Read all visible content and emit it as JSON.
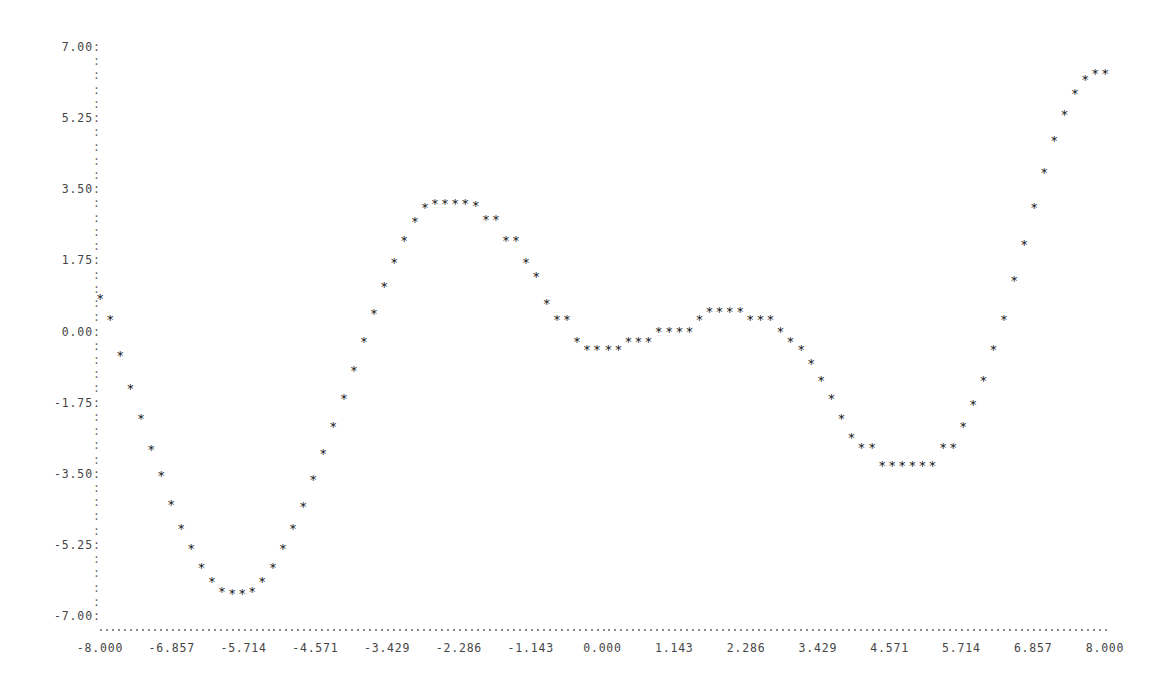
{
  "chart_data": {
    "type": "scatter",
    "title": "",
    "subtitle": "",
    "xlabel": "",
    "ylabel": "",
    "xlim": [
      -8.0,
      8.0
    ],
    "ylim": [
      -7.0,
      7.0
    ],
    "grid": false,
    "legend": null,
    "marker": "asterisk",
    "marker_color": "#1a1a1a",
    "x_tick_labels": [
      "-8.000",
      "-6.857",
      "-5.714",
      "-4.571",
      "-3.429",
      "-2.286",
      "-1.143",
      "0.000",
      "1.143",
      "2.286",
      "3.429",
      "4.571",
      "5.714",
      "6.857",
      "8.000"
    ],
    "x_tick_values": [
      -8.0,
      -6.857,
      -5.714,
      -4.571,
      -3.429,
      -2.286,
      -1.143,
      0.0,
      1.143,
      2.286,
      3.429,
      4.571,
      5.714,
      6.857,
      8.0
    ],
    "y_tick_labels": [
      "7.00",
      "5.25",
      "3.50",
      "1.75",
      "0.00",
      "-1.75",
      "-3.50",
      "-5.25",
      "-7.00"
    ],
    "y_tick_values": [
      7.0,
      5.25,
      3.5,
      1.75,
      0.0,
      -1.75,
      -3.5,
      -5.25,
      -7.0
    ],
    "y_minor_per_interval": 4,
    "series": [
      {
        "name": "series-1",
        "x": [
          -8.0,
          -7.84,
          -7.68,
          -7.52,
          -7.35,
          -7.19,
          -7.03,
          -6.87,
          -6.71,
          -6.55,
          -6.39,
          -6.22,
          -6.06,
          -5.9,
          -5.74,
          -5.58,
          -5.42,
          -5.25,
          -5.09,
          -4.93,
          -4.77,
          -4.61,
          -4.45,
          -4.29,
          -4.12,
          -3.96,
          -3.8,
          -3.64,
          -3.48,
          -3.32,
          -3.16,
          -2.99,
          -2.83,
          -2.67,
          -2.51,
          -2.35,
          -2.19,
          -2.02,
          -1.86,
          -1.7,
          -1.54,
          -1.38,
          -1.22,
          -1.06,
          -0.89,
          -0.73,
          -0.57,
          -0.41,
          -0.25,
          -0.09,
          0.09,
          0.25,
          0.41,
          0.57,
          0.73,
          0.89,
          1.06,
          1.22,
          1.38,
          1.54,
          1.7,
          1.86,
          2.02,
          2.19,
          2.35,
          2.51,
          2.67,
          2.83,
          2.99,
          3.16,
          3.32,
          3.48,
          3.64,
          3.8,
          3.96,
          4.12,
          4.29,
          4.45,
          4.61,
          4.77,
          4.93,
          5.09,
          5.25,
          5.42,
          5.58,
          5.74,
          5.9,
          6.06,
          6.22,
          6.39,
          6.55,
          6.71,
          6.87,
          7.03,
          7.19,
          7.35,
          7.52,
          7.68,
          7.84,
          8.0
        ],
        "y": [
          0.85,
          0.35,
          -0.55,
          -1.35,
          -2.1,
          -2.85,
          -3.5,
          -4.2,
          -4.8,
          -5.3,
          -5.75,
          -6.1,
          -6.35,
          -6.4,
          -6.4,
          -6.35,
          -6.1,
          -5.75,
          -5.3,
          -4.8,
          -4.25,
          -3.6,
          -2.95,
          -2.3,
          -1.6,
          -0.9,
          -0.2,
          0.5,
          1.15,
          1.75,
          2.3,
          2.75,
          3.1,
          3.2,
          3.2,
          3.2,
          3.2,
          3.15,
          2.8,
          2.8,
          2.3,
          2.3,
          1.75,
          1.4,
          0.75,
          0.35,
          0.35,
          -0.2,
          -0.4,
          -0.4,
          -0.4,
          -0.4,
          -0.2,
          -0.2,
          -0.2,
          0.05,
          0.05,
          0.05,
          0.05,
          0.35,
          0.55,
          0.55,
          0.55,
          0.55,
          0.35,
          0.35,
          0.35,
          0.05,
          -0.2,
          -0.4,
          -0.75,
          -1.15,
          -1.6,
          -2.1,
          -2.55,
          -2.8,
          -2.8,
          -3.25,
          -3.25,
          -3.25,
          -3.25,
          -3.25,
          -3.25,
          -2.8,
          -2.8,
          -2.3,
          -1.75,
          -1.15,
          -0.4,
          0.35,
          1.3,
          2.2,
          3.1,
          3.95,
          4.75,
          5.4,
          5.9,
          6.25,
          6.4,
          6.4
        ]
      }
    ]
  }
}
